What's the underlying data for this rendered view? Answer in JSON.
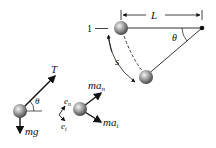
{
  "pendulum": {
    "length_label": "L",
    "angle_label": "θ",
    "arc_label": "s",
    "position_label": "1"
  },
  "free_body_diagram": {
    "tension_label": "T",
    "weight_label": "mg",
    "angle_label": "θ"
  },
  "axes": {
    "normal_label": "e",
    "normal_sub": "n",
    "tangent_label": "e",
    "tangent_sub": "t"
  },
  "kinetic_diagram": {
    "normal_label": "ma",
    "normal_sub": "n",
    "tangent_label": "ma",
    "tangent_sub": "t"
  }
}
